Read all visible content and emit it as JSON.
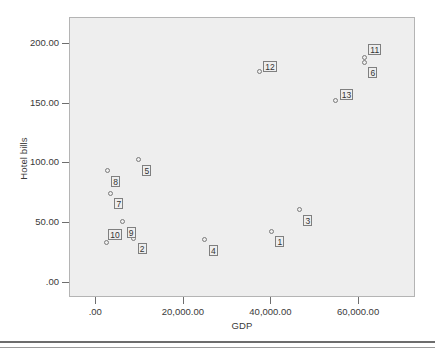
{
  "chart_data": {
    "type": "scatter",
    "title": "",
    "xlabel": "GDP",
    "ylabel": "Hotel bills",
    "xlim": [
      -6000,
      73000
    ],
    "ylim": [
      -13,
      222
    ],
    "grid": false,
    "legend": "none",
    "xticks": [
      0,
      20000,
      40000,
      60000
    ],
    "xticklabels": [
      ".00",
      "20,000.00",
      "40,000.00",
      "60,000.00"
    ],
    "yticks": [
      0,
      50,
      100,
      150,
      200
    ],
    "yticklabels": [
      ".00",
      "50.00",
      "100.00",
      "150.00",
      "200.00"
    ],
    "point_label_field": "id",
    "points": [
      {
        "id": "1",
        "x": 40000,
        "y": 43,
        "label_dx": 4,
        "label_dy": 5
      },
      {
        "id": "2",
        "x": 8500,
        "y": 37,
        "label_dx": 4,
        "label_dy": 5
      },
      {
        "id": "3",
        "x": 46400,
        "y": 61,
        "label_dx": 4,
        "label_dy": 5
      },
      {
        "id": "4",
        "x": 24800,
        "y": 36,
        "label_dx": 4,
        "label_dy": 5
      },
      {
        "id": "5",
        "x": 9600,
        "y": 103,
        "label_dx": 4,
        "label_dy": 5
      },
      {
        "id": "6",
        "x": 61200,
        "y": 185,
        "label_dx": 4,
        "label_dy": 5
      },
      {
        "id": "7",
        "x": 3200,
        "y": 75,
        "label_dx": 4,
        "label_dy": 5
      },
      {
        "id": "8",
        "x": 2500,
        "y": 94,
        "label_dx": 4,
        "label_dy": 5
      },
      {
        "id": "9",
        "x": 6000,
        "y": 51,
        "label_dx": 4,
        "label_dy": 5
      },
      {
        "id": "10",
        "x": 2300,
        "y": 34,
        "label_dx": 2,
        "label_dy": -13
      },
      {
        "id": "11",
        "x": 61200,
        "y": 189,
        "label_dx": 4,
        "label_dy": -13
      },
      {
        "id": "12",
        "x": 37200,
        "y": 177,
        "label_dx": 4,
        "label_dy": -11
      },
      {
        "id": "13",
        "x": 54700,
        "y": 153,
        "label_dx": 4,
        "label_dy": -11
      }
    ]
  },
  "colors": {
    "plot_background": "#eeeeee",
    "frame": "#b4b4b4",
    "marker_stroke": "#7a7a7a",
    "label_box_border": "#7f7f7f",
    "text": "#3a3a3a",
    "rule": "#6d6d6d"
  }
}
